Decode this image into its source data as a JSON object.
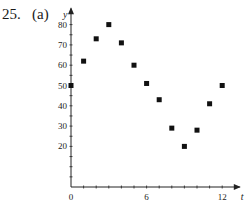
{
  "problem": {
    "number": "25.",
    "part": "(a)"
  },
  "chart_data": {
    "type": "scatter",
    "title": "",
    "xlabel": "t",
    "ylabel": "y",
    "x": [
      0,
      1,
      2,
      3,
      4,
      5,
      6,
      7,
      8,
      9,
      10,
      11,
      12
    ],
    "series": [
      {
        "name": "data",
        "values": [
          50,
          62,
          73,
          80,
          71,
          60,
          51,
          43,
          29,
          20,
          28,
          41,
          50
        ]
      }
    ],
    "xlim": [
      0,
      13
    ],
    "ylim": [
      0,
      88
    ],
    "x_tick_labels": [
      "0",
      "6",
      "12"
    ],
    "x_ticks_minor": [
      1,
      2,
      3,
      4,
      5,
      6,
      7,
      8,
      9,
      10,
      11,
      12
    ],
    "y_tick_labels": [
      "20",
      "30",
      "40",
      "50",
      "60",
      "70",
      "80"
    ],
    "y_ticks_minor": [
      5,
      10,
      15,
      20,
      25,
      30,
      35,
      40,
      45,
      50,
      55,
      60,
      65,
      70,
      75,
      80
    ],
    "grid": false,
    "legend": false,
    "marker": "square",
    "marker_color": "#111111"
  }
}
